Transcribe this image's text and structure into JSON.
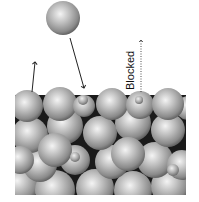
{
  "diagram": {
    "type": "particle-deposition-schematic",
    "labels": {
      "blocked": "Blocked"
    },
    "colors": {
      "background": "#ffffff",
      "sphere_light": "#f2f2f2",
      "sphere_mid": "#a8a8a8",
      "sphere_dark": "#5a5a5a",
      "gap": "#1a1a1a",
      "arrow": "#222222"
    },
    "free_particle": {
      "cx": 63,
      "cy": 18,
      "r": 17
    },
    "packed_region": {
      "x": 15,
      "y": 90,
      "width": 170,
      "height": 105
    },
    "arrows": [
      {
        "name": "desorption-arrow",
        "x1": 32,
        "y1": 92,
        "x2": 35,
        "y2": 62,
        "style": "solid"
      },
      {
        "name": "deposition-arrow",
        "x1": 70,
        "y1": 38,
        "x2": 84,
        "y2": 88,
        "style": "solid"
      },
      {
        "name": "blocked-arrow",
        "x1": 141,
        "y1": 92,
        "x2": 141,
        "y2": 40,
        "style": "dotted"
      }
    ]
  }
}
